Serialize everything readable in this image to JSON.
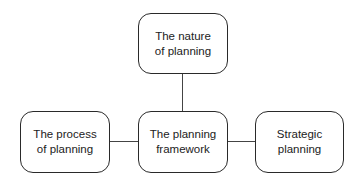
{
  "diagram": {
    "nodes": [
      {
        "id": "top",
        "line1": "The nature",
        "line2": "of planning"
      },
      {
        "id": "center",
        "line1": "The planning",
        "line2": "framework"
      },
      {
        "id": "left",
        "line1": "The process",
        "line2": "of planning"
      },
      {
        "id": "right",
        "line1": "Strategic",
        "line2": "planning"
      }
    ],
    "edges": [
      {
        "from": "center",
        "to": "top"
      },
      {
        "from": "center",
        "to": "left"
      },
      {
        "from": "center",
        "to": "right"
      }
    ]
  }
}
